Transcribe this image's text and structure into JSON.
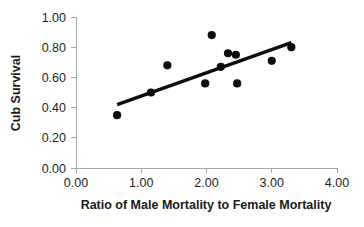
{
  "chart_data": {
    "type": "scatter",
    "title": "",
    "xlabel": "Ratio of Male Mortality to Female Mortality",
    "ylabel": "Cub Survival",
    "xlim": [
      0.0,
      4.0
    ],
    "ylim": [
      0.0,
      1.0
    ],
    "grid": false,
    "legend": false,
    "xticks": [
      0.0,
      1.0,
      2.0,
      3.0,
      4.0
    ],
    "xtick_labels": [
      "0.00",
      "1.00",
      "2.00",
      "3.00",
      "4.00"
    ],
    "yticks": [
      0.0,
      0.2,
      0.4,
      0.6,
      0.8,
      1.0
    ],
    "ytick_labels": [
      "0.00",
      "0.20",
      "0.40",
      "0.60",
      "0.80",
      "1.00"
    ],
    "series": [
      {
        "name": "Cub survival vs male:female mortality ratio",
        "marker": "circle",
        "color": "#0d0d0d",
        "points": [
          {
            "x": 0.63,
            "y": 0.35
          },
          {
            "x": 1.15,
            "y": 0.5
          },
          {
            "x": 1.4,
            "y": 0.68
          },
          {
            "x": 1.98,
            "y": 0.56
          },
          {
            "x": 2.08,
            "y": 0.88
          },
          {
            "x": 2.22,
            "y": 0.67
          },
          {
            "x": 2.33,
            "y": 0.76
          },
          {
            "x": 2.45,
            "y": 0.75
          },
          {
            "x": 2.47,
            "y": 0.56
          },
          {
            "x": 3.0,
            "y": 0.71
          },
          {
            "x": 3.3,
            "y": 0.8
          }
        ]
      }
    ],
    "trendline": {
      "name": "linear-fit",
      "color": "#0d0d0d",
      "x_start": 0.63,
      "y_start": 0.42,
      "x_end": 3.3,
      "y_end": 0.83
    },
    "annotations": []
  },
  "colors": {
    "marker": "#0d0d0d",
    "trendline": "#0d0d0d",
    "axis": "#a6a6a6",
    "text": "#231f20",
    "background": "#ffffff"
  }
}
